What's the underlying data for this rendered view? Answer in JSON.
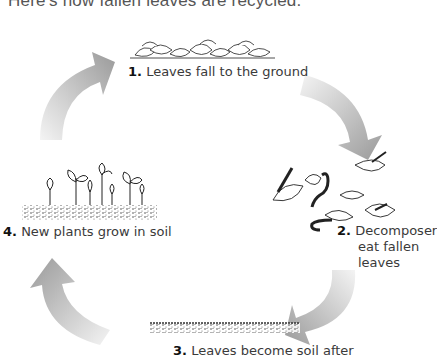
{
  "title": "Here's how fallen leaves are recycled.",
  "steps": [
    {
      "number": "1.",
      "text": "Leaves fall to the ground"
    },
    {
      "number": "2.",
      "text": "Decomposer",
      "text2": "eat fallen",
      "text3": "leaves"
    },
    {
      "number": "3.",
      "text": "Leaves become soil after"
    },
    {
      "number": "4.",
      "text": "New plants grow in soil"
    }
  ],
  "colors": {
    "arrow": "#9a9a9a",
    "arrow_fade": "#f2f2f2",
    "text": "#3a3a3a",
    "ink": "#222222"
  }
}
